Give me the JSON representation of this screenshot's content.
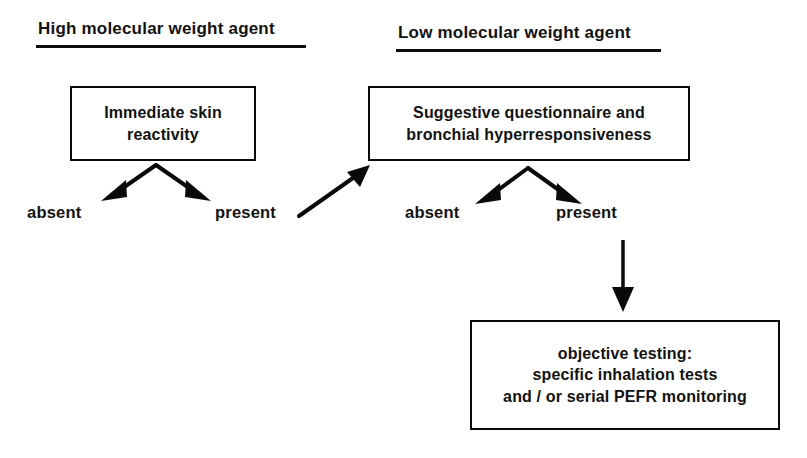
{
  "figure": {
    "type": "flowchart",
    "orientation": "top-down",
    "background_color": "#ffffff",
    "line_color": "#0a0a0a",
    "text_color": "#121212"
  },
  "headings": [
    {
      "id": "hmw",
      "label": "High molecular weight agent",
      "underlined": true
    },
    {
      "id": "lmw",
      "label": "Low molecular weight agent",
      "underlined": true
    }
  ],
  "boxes": [
    {
      "id": "skin-reactivity",
      "lines": [
        "Immediate skin",
        "reactivity"
      ]
    },
    {
      "id": "questionnaire-bhr",
      "lines": [
        "Suggestive questionnaire and",
        "bronchial hyperresponsiveness"
      ]
    },
    {
      "id": "objective-testing",
      "lines": [
        "objective testing:",
        "specific inhalation tests",
        "and / or serial PEFR monitoring"
      ]
    }
  ],
  "branch_labels": {
    "left_absent": "absent",
    "left_present": "present",
    "right_absent": "absent",
    "right_present": "present"
  }
}
